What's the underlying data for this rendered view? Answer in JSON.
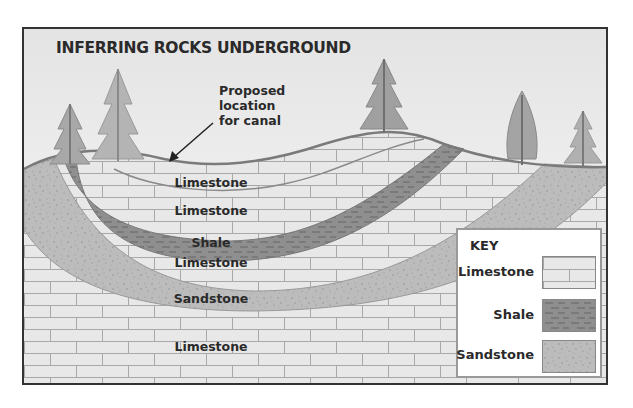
{
  "diagram": {
    "title": "INFERRING  ROCKS UNDERGROUND",
    "callout": {
      "lines": [
        "Proposed",
        "location",
        "for canal"
      ],
      "arrow_target": "land surface in valley"
    },
    "layers": [
      {
        "label": "Limestone",
        "position": "top valley fill"
      },
      {
        "label": "Limestone",
        "position": "upper"
      },
      {
        "label": "Shale",
        "position": "middle band"
      },
      {
        "label": "Limestone",
        "position": "lower-middle"
      },
      {
        "label": "Sandstone",
        "position": "lower band"
      },
      {
        "label": "Limestone",
        "position": "bottom"
      }
    ],
    "key": {
      "title": "KEY",
      "items": [
        {
          "label": "Limestone",
          "pattern": "brick",
          "color": "#e6e6e6"
        },
        {
          "label": "Shale",
          "pattern": "dashes",
          "color": "#8c8c8c"
        },
        {
          "label": "Sandstone",
          "pattern": "dots",
          "color": "#bdbdbd"
        }
      ]
    },
    "colors": {
      "sky": "#f2f2f2",
      "limestone": "#e8e8e8",
      "brick_lines": "#a8a8a8",
      "shale": "#8f8f8f",
      "sandstone": "#bcbcbc",
      "tree": "#a0a0a0",
      "outline": "#7a7a7a"
    }
  }
}
